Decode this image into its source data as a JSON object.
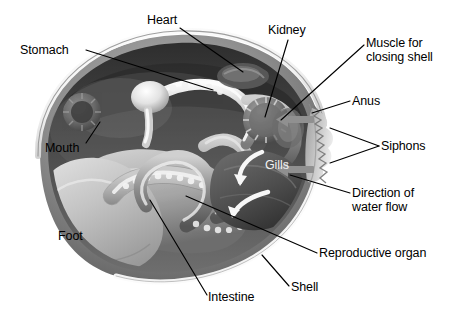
{
  "figure": {
    "background_color": "#ffffff",
    "ink_color": "#000000",
    "palette": {
      "shell_rim": "#fdfdfd",
      "shell_edge": "#9a9a9a",
      "mantle_dark": "#3b3b3b",
      "body_mid": "#8e8e8e",
      "body_light": "#d9d9d9",
      "foot": "#bdbdbd",
      "gut_highlight": "#f0f0f0",
      "arrow_gray": "#8f8f8f"
    }
  },
  "labels": [
    {
      "id": "stomach",
      "text": "Stomach",
      "x": 20,
      "y": 44,
      "align": "left",
      "color": "black"
    },
    {
      "id": "heart",
      "text": "Heart",
      "x": 147,
      "y": 14,
      "align": "left",
      "color": "black"
    },
    {
      "id": "kidney",
      "text": "Kidney",
      "x": 268,
      "y": 24,
      "align": "left",
      "color": "black"
    },
    {
      "id": "muscle",
      "text": "Muscle for\nclosing shell",
      "x": 366,
      "y": 37,
      "align": "left",
      "color": "black"
    },
    {
      "id": "anus",
      "text": "Anus",
      "x": 352,
      "y": 95,
      "align": "left",
      "color": "black"
    },
    {
      "id": "siphons",
      "text": "Siphons",
      "x": 381,
      "y": 140,
      "align": "left",
      "color": "black"
    },
    {
      "id": "mouth",
      "text": "Mouth",
      "x": 45,
      "y": 142,
      "align": "left",
      "color": "black"
    },
    {
      "id": "gills",
      "text": "Gills",
      "x": 265,
      "y": 159,
      "align": "left",
      "color": "white"
    },
    {
      "id": "water-flow",
      "text": "Direction of\nwater flow",
      "x": 352,
      "y": 187,
      "align": "left",
      "color": "black"
    },
    {
      "id": "foot",
      "text": "Foot",
      "x": 58,
      "y": 230,
      "align": "left",
      "color": "black"
    },
    {
      "id": "reproductive",
      "text": "Reproductive organ",
      "x": 319,
      "y": 247,
      "align": "left",
      "color": "black"
    },
    {
      "id": "shell",
      "text": "Shell",
      "x": 291,
      "y": 281,
      "align": "left",
      "color": "black"
    },
    {
      "id": "intestine",
      "text": "Intestine",
      "x": 208,
      "y": 291,
      "align": "left",
      "color": "black"
    }
  ],
  "leader_lines": [
    {
      "id": "stomach-leader",
      "from": [
        86,
        50
      ],
      "to": [
        213,
        90
      ]
    },
    {
      "id": "heart-leader",
      "from": [
        180,
        28
      ],
      "to": [
        243,
        72
      ]
    },
    {
      "id": "kidney-leader",
      "from": [
        288,
        40
      ],
      "to": [
        265,
        117
      ]
    },
    {
      "id": "muscle-leader",
      "from": [
        364,
        45
      ],
      "to": [
        281,
        120
      ]
    },
    {
      "id": "anus-leader",
      "from": [
        350,
        101
      ],
      "to": [
        312,
        113
      ]
    },
    {
      "id": "siphons-leader-a",
      "from": [
        379,
        146
      ],
      "to": [
        330,
        128
      ]
    },
    {
      "id": "siphons-leader-b",
      "from": [
        379,
        146
      ],
      "to": [
        330,
        163
      ]
    },
    {
      "id": "mouth-leader",
      "from": [
        86,
        143
      ],
      "to": [
        100,
        122
      ]
    },
    {
      "id": "waterflow-leader",
      "from": [
        350,
        193
      ],
      "to": [
        290,
        175
      ]
    },
    {
      "id": "reproductive-leader",
      "from": [
        317,
        253
      ],
      "to": [
        186,
        196
      ]
    },
    {
      "id": "shell-leader",
      "from": [
        289,
        286
      ],
      "to": [
        262,
        255
      ]
    },
    {
      "id": "intestine-leader",
      "from": [
        207,
        295
      ],
      "to": [
        150,
        200
      ]
    }
  ],
  "anatomy_parts": [
    "shell",
    "mantle-cavity",
    "stomach",
    "heart",
    "kidney",
    "adductor-muscle",
    "anus",
    "siphons",
    "mouth",
    "gills",
    "foot",
    "reproductive-organ",
    "intestine"
  ],
  "water_flow_arrows": {
    "count": 2,
    "direction": "leftward-into-siphons",
    "color": "#8f8f8f"
  },
  "gill_arrows": {
    "count": 2,
    "color": "#f5f5f5"
  }
}
